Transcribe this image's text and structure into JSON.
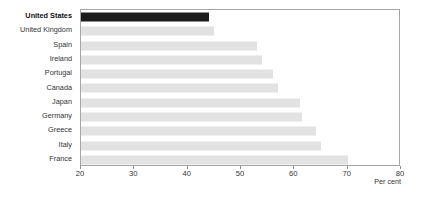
{
  "chart_data": {
    "type": "bar",
    "orientation": "horizontal",
    "title": "",
    "subtitle": "",
    "xlabel": "Per cent",
    "ylabel": "",
    "xlim": [
      20,
      80
    ],
    "xticks": [
      20,
      30,
      40,
      50,
      60,
      70,
      80
    ],
    "xtick_labels": [
      "20",
      "30",
      "40",
      "50",
      "60",
      "70",
      "80"
    ],
    "grid": false,
    "legend": false,
    "categories": [
      "United States",
      "United Kingdom",
      "Spain",
      "Ireland",
      "Portugal",
      "Canada",
      "Japan",
      "Germany",
      "Greece",
      "Italy",
      "France"
    ],
    "values": [
      44,
      45,
      53,
      54,
      56,
      57,
      61,
      61.5,
      64,
      65,
      70
    ],
    "highlighted": [
      "United States"
    ],
    "colors": {
      "bar": "#e2e2e2",
      "bar_highlight": "#1c1c1c",
      "frame": "#a6a6a6",
      "text": "#333333",
      "background": "#ffffff"
    }
  },
  "axis": {
    "unit_label": "Per cent"
  }
}
